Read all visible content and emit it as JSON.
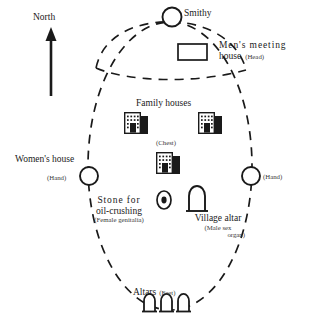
{
  "colors": {
    "ink": "#1a1a1a",
    "subtext": "#3a3a3a",
    "background": "#ffffff",
    "building_shadow": "#1a1a1a"
  },
  "compass": {
    "label": "North",
    "direction": "up",
    "icon": "north-arrow-icon"
  },
  "boundary": {
    "outer_shape": "dashed-ellipse",
    "inner_shape": "dashed-arc-dome"
  },
  "features": {
    "smithy": {
      "label": "Smithy",
      "icon": "circle-icon"
    },
    "mens_meeting_house": {
      "label": "Men's  meeting house",
      "line1": "Men's  meeting",
      "line2": "house",
      "body_part": "(Head)",
      "icon": "rectangle-icon"
    },
    "family_houses": {
      "label": "Family houses",
      "body_part": "(Chest)",
      "icon": "building-icon",
      "count": 3
    },
    "womens_house": {
      "label": "Women's house",
      "body_part": "(Hand)",
      "icon": "circle-icon"
    },
    "right_hand": {
      "body_part": "(Hand)",
      "icon": "circle-icon"
    },
    "oil_stone": {
      "line1": "Stone  for",
      "line2": "oil-crushing",
      "body_part": "(Female  genitalia)",
      "icon": "concentric-circle-icon"
    },
    "village_altar": {
      "label": "Village altar",
      "body_part_line1": "(Male  sex",
      "body_part_line2": "organ)",
      "icon": "arch-altar-icon"
    },
    "altars": {
      "label": "Altars",
      "body_part": "(Feet)",
      "icon": "arch-altar-icon",
      "count": 3
    }
  }
}
